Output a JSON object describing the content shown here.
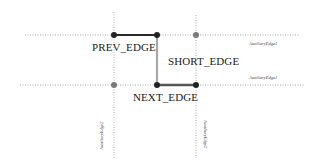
{
  "diagram": {
    "edges": {
      "prev": {
        "label": "PREV_EDGE",
        "color": "#2a2a2a"
      },
      "short": {
        "label": "SHORT_EDGE",
        "color": "#9a9a9a"
      },
      "next": {
        "label": "NEXT_EDGE",
        "color": "#555555"
      }
    },
    "auxiliary": {
      "top_right_label": "AuxiliaryEdge1",
      "mid_right_label": "AuxiliaryEdge1",
      "left_vertical_label": "AuxiliaryEdge2",
      "right_vertical_label": "AuxiliaryEdge2",
      "line_color": "#9a9a9a"
    },
    "nodes": {
      "dark_color": "#222222",
      "gray_color": "#7a7a7a"
    }
  }
}
